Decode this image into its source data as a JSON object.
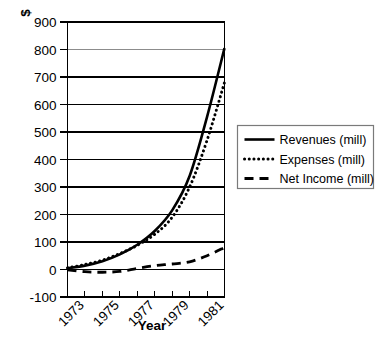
{
  "chart_data": {
    "type": "line",
    "title": "",
    "xlabel": "Year",
    "ylabel": "$",
    "x": [
      1972,
      1973,
      1974,
      1975,
      1976,
      1977,
      1978,
      1979,
      1980,
      1981
    ],
    "xtick_labels": [
      "1973",
      "1975",
      "1977",
      "1979",
      "1981"
    ],
    "xtick_values": [
      1973,
      1975,
      1977,
      1979,
      1981
    ],
    "ytick_labels": [
      "-100",
      "0",
      "100",
      "200",
      "300",
      "400",
      "500",
      "600",
      "700",
      "800",
      "900"
    ],
    "ytick_values": [
      -100,
      0,
      100,
      200,
      300,
      400,
      500,
      600,
      700,
      800,
      900
    ],
    "ylim": [
      -100,
      900
    ],
    "xlim": [
      1972,
      1981
    ],
    "grid": "horizontal",
    "legend_position": "right",
    "series": [
      {
        "name": "Revenues (mill)",
        "style": "solid",
        "values": [
          5,
          14,
          30,
          55,
          90,
          140,
          215,
          340,
          555,
          805
        ]
      },
      {
        "name": "Expenses (mill)",
        "style": "dotted",
        "values": [
          6,
          18,
          34,
          58,
          88,
          128,
          190,
          300,
          470,
          680
        ]
      },
      {
        "name": "Net Income (mill)",
        "style": "dashed",
        "values": [
          -1,
          -8,
          -10,
          -7,
          4,
          14,
          20,
          28,
          50,
          80
        ]
      }
    ]
  },
  "axes": {
    "y_axis_title": "$",
    "x_axis_title": "Year"
  },
  "legend": {
    "entries": [
      {
        "label": "Revenues (mill)",
        "style": "solid"
      },
      {
        "label": "Expenses (mill)",
        "style": "dotted"
      },
      {
        "label": "Net Income (mill)",
        "style": "dashed"
      }
    ]
  }
}
